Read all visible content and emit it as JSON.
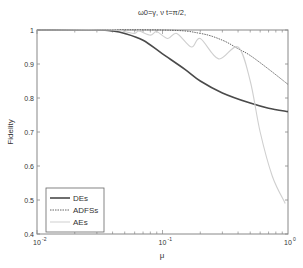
{
  "chart_data": {
    "type": "line",
    "title": "ω0=γ, ν t=π/2,",
    "xlabel": "μ",
    "ylabel": "Fidelity",
    "xscale": "log",
    "xlim": [
      0.01,
      1
    ],
    "ylim": [
      0.4,
      1
    ],
    "xticks": [
      "10^-2",
      "10^-1",
      "10^0"
    ],
    "yticks": [
      "0.4",
      "0.5",
      "0.6",
      "0.7",
      "0.8",
      "0.9",
      "1"
    ],
    "grid": false,
    "legend_position": "lower left",
    "series": [
      {
        "name": "DEs",
        "style": "solid",
        "color": "#4a4a4a",
        "x": [
          0.01,
          0.03,
          0.04,
          0.05,
          0.07,
          0.1,
          0.15,
          0.2,
          0.3,
          0.5,
          0.7,
          1.0
        ],
        "y": [
          1.0,
          1.0,
          0.997,
          0.99,
          0.97,
          0.93,
          0.885,
          0.85,
          0.815,
          0.785,
          0.77,
          0.76
        ]
      },
      {
        "name": "ADFSs",
        "style": "dashed",
        "color": "#555555",
        "x": [
          0.01,
          0.1,
          0.2,
          0.3,
          0.4,
          0.5,
          0.7,
          1.0
        ],
        "y": [
          1.0,
          1.0,
          0.99,
          0.97,
          0.945,
          0.925,
          0.885,
          0.84
        ]
      },
      {
        "name": "AEs",
        "style": "solid-light",
        "color": "#cfcfcf",
        "x": [
          0.01,
          0.04,
          0.05,
          0.06,
          0.065,
          0.08,
          0.09,
          0.11,
          0.13,
          0.17,
          0.2,
          0.28,
          0.4,
          0.5,
          0.6,
          0.75,
          0.95
        ],
        "y": [
          1.0,
          1.0,
          0.995,
          0.99,
          0.997,
          0.985,
          0.995,
          0.975,
          0.99,
          0.95,
          0.975,
          0.915,
          0.95,
          0.85,
          0.7,
          0.57,
          0.49
        ]
      }
    ]
  }
}
